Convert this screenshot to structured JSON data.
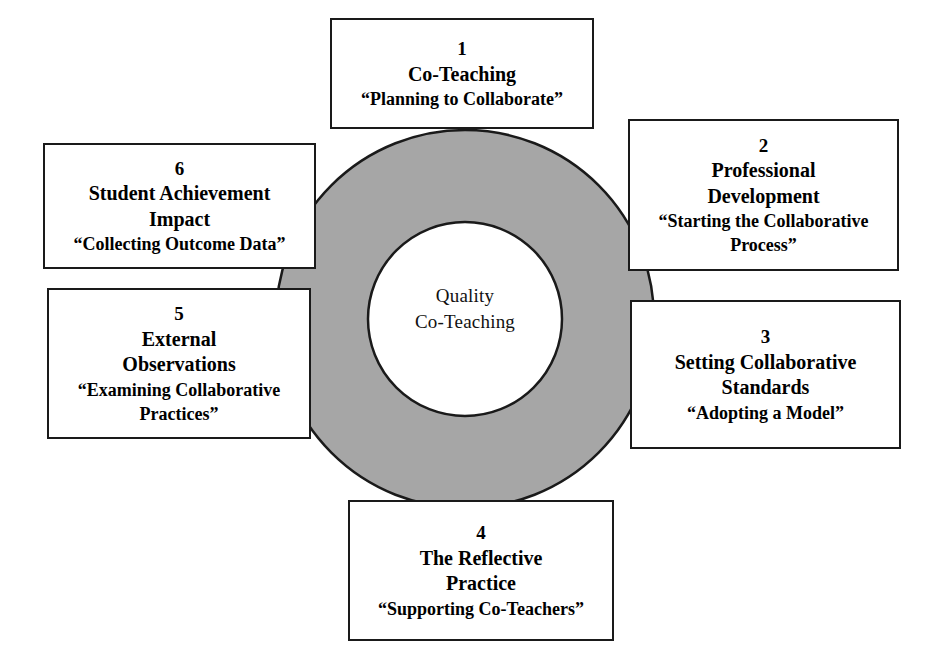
{
  "diagram": {
    "center": {
      "line1": "Quality",
      "line2": "Co-Teaching"
    },
    "colors": {
      "ring_fill": "#a6a6a6",
      "ring_stroke": "#1a1a1a",
      "inner_fill": "#ffffff",
      "box_fill": "#ffffff",
      "box_stroke": "#1a1a1a",
      "text": "#000000",
      "background": "#ffffff"
    },
    "steps": [
      {
        "number": "1",
        "title_line1": "Co-Teaching",
        "title_line2": "",
        "subtitle_line1": "“Planning to Collaborate”",
        "subtitle_line2": "",
        "position": "top"
      },
      {
        "number": "2",
        "title_line1": "Professional",
        "title_line2": "Development",
        "subtitle_line1": "“Starting the Collaborative",
        "subtitle_line2": "Process”",
        "position": "right-upper"
      },
      {
        "number": "3",
        "title_line1": "Setting Collaborative",
        "title_line2": "Standards",
        "subtitle_line1": "“Adopting a Model”",
        "subtitle_line2": "",
        "position": "right-lower"
      },
      {
        "number": "4",
        "title_line1": "The Reflective",
        "title_line2": "Practice",
        "subtitle_line1": "“Supporting Co-Teachers”",
        "subtitle_line2": "",
        "position": "bottom"
      },
      {
        "number": "5",
        "title_line1": "External",
        "title_line2": "Observations",
        "subtitle_line1": "“Examining Collaborative",
        "subtitle_line2": "Practices”",
        "position": "left-lower"
      },
      {
        "number": "6",
        "title_line1": "Student Achievement",
        "title_line2": "Impact",
        "subtitle_line1": "“Collecting Outcome Data”",
        "subtitle_line2": "",
        "position": "left-upper"
      }
    ]
  }
}
